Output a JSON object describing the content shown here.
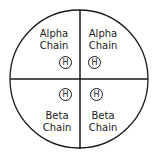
{
  "diagram": {
    "shape": "circle divided into four quadrants",
    "quadrants": [
      {
        "position": "top-left",
        "label_line1": "Alpha",
        "label_line2": "Chain",
        "heme": "H"
      },
      {
        "position": "top-right",
        "label_line1": "Alpha",
        "label_line2": "Chain",
        "heme": "H"
      },
      {
        "position": "bottom-left",
        "label_line1": "Beta",
        "label_line2": "Chain",
        "heme": "H"
      },
      {
        "position": "bottom-right",
        "label_line1": "Beta",
        "label_line2": "Chain",
        "heme": "H"
      }
    ],
    "colors": {
      "line": "#1a1a1a",
      "background": "#ffffff"
    }
  }
}
